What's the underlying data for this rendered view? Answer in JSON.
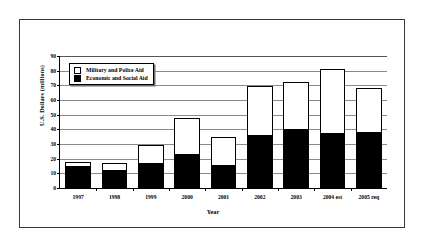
{
  "chart_data": {
    "type": "bar",
    "subtype": "stacked-vertical",
    "title": "",
    "xlabel": "Year",
    "ylabel": "U.S. Dollars (millions)",
    "categories": [
      "1997",
      "1998",
      "1999",
      "2000",
      "2001",
      "2002",
      "2003",
      "2004 est",
      "2005 req"
    ],
    "series": [
      {
        "name": "Economic and Social Aid",
        "color": "#000000",
        "values": [
          15,
          12,
          17,
          23.5,
          16,
          36,
          40,
          37.5,
          38
        ]
      },
      {
        "name": "Military and Police Aid",
        "color": "#ffffff",
        "values": [
          2.5,
          5,
          12.5,
          24.5,
          18.5,
          33.5,
          32.5,
          43.5,
          30
        ]
      }
    ],
    "totals": [
      17.5,
      17,
      29.5,
      48,
      34.5,
      69.5,
      72.5,
      81,
      68
    ],
    "ylim": [
      0,
      90
    ],
    "yticks": [
      0,
      10,
      20,
      30,
      40,
      50,
      60,
      70,
      80,
      90
    ],
    "ytick_labels": [
      "0",
      "10",
      "20",
      "30",
      "40",
      "50",
      "60",
      "70",
      "80",
      "90"
    ],
    "grid": true,
    "grid_axis": "y",
    "legend_position": "upper-left-inside",
    "stack_order": [
      "Economic and Social Aid",
      "Military and Police Aid"
    ]
  },
  "legend": {
    "entries": [
      {
        "label": "Military and Police Aid",
        "swatch": "hollow-square"
      },
      {
        "label": "Economic and Social Aid",
        "swatch": "filled-square"
      }
    ]
  },
  "axes": {
    "y_title": "U.S. Dollars (millions)",
    "x_title": "Year"
  }
}
